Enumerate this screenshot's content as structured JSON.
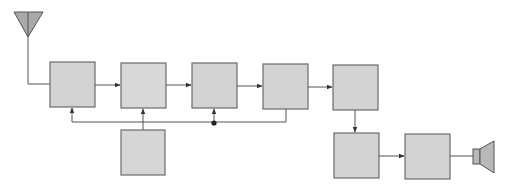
{
  "diagram": {
    "title": "",
    "colors": {
      "background": "#ffffff",
      "block_fill": "#d3d3d3",
      "block_stroke": "#6b6b6b",
      "line": "#555555",
      "antenna_fill": "#a9a9a9",
      "speaker_fill": "#b8b8b8"
    },
    "blocks": [
      {
        "id": "block-1",
        "label": "",
        "x": 50,
        "y": 62,
        "w": 45,
        "h": 45
      },
      {
        "id": "block-2",
        "label": "",
        "x": 121,
        "y": 63,
        "w": 45,
        "h": 45
      },
      {
        "id": "block-3",
        "label": "",
        "x": 192,
        "y": 63,
        "w": 45,
        "h": 45
      },
      {
        "id": "block-4",
        "label": "",
        "x": 263,
        "y": 64,
        "w": 45,
        "h": 45
      },
      {
        "id": "block-5",
        "label": "",
        "x": 333,
        "y": 65,
        "w": 45,
        "h": 45
      },
      {
        "id": "block-6",
        "label": "",
        "x": 334,
        "y": 133,
        "w": 45,
        "h": 45
      },
      {
        "id": "block-7",
        "label": "",
        "x": 405,
        "y": 134,
        "w": 45,
        "h": 45
      },
      {
        "id": "block-8",
        "label": "",
        "x": 121,
        "y": 130,
        "w": 44,
        "h": 45
      }
    ],
    "antenna": {
      "apex_x": 28,
      "top_y": 12,
      "tip_y": 37,
      "half_width": 14
    },
    "speaker": {
      "x": 473,
      "y": 141
    },
    "connections": [
      {
        "from": "antenna",
        "to": "block-1"
      },
      {
        "from": "block-1",
        "to": "block-2"
      },
      {
        "from": "block-2",
        "to": "block-3"
      },
      {
        "from": "block-3",
        "to": "block-4"
      },
      {
        "from": "block-4",
        "to": "block-5"
      },
      {
        "from": "block-5",
        "to": "block-6"
      },
      {
        "from": "block-6",
        "to": "block-7"
      },
      {
        "from": "block-7",
        "to": "speaker"
      },
      {
        "from": "block-8",
        "to": "bus"
      },
      {
        "from": "block-4",
        "to": "bus"
      },
      {
        "from": "bus",
        "to": "block-1"
      },
      {
        "from": "bus",
        "to": "block-2"
      },
      {
        "from": "bus-junction",
        "to": "block-3"
      }
    ],
    "bus": {
      "y": 122,
      "x_start": 72,
      "x_end": 286,
      "junction_x": 214
    }
  }
}
